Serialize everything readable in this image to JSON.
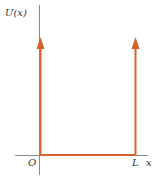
{
  "diagram": {
    "y_axis_label": "U(x)",
    "x_axis_label": "x",
    "origin_label": "O",
    "well_width_label": "L",
    "colors": {
      "axis": "#808080",
      "potential": "#d4622a",
      "text": "#333333"
    }
  }
}
